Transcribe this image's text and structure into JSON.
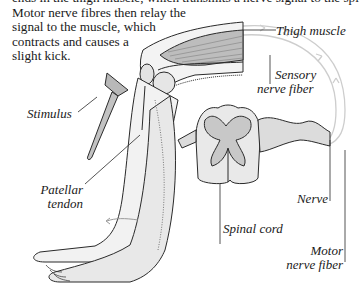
{
  "caption": {
    "lines": [
      "ends in the thigh muscle, which transmits a nerve signal to the spinal cord.",
      "Motor nerve fibres then relay the",
      "signal to the muscle, which",
      "contracts and causes a",
      "slight kick."
    ]
  },
  "labels": {
    "thigh_muscle": "Thigh muscle",
    "sensory_nerve_fiber": [
      "Sensory",
      "nerve fiber"
    ],
    "stimulus": "Stimulus",
    "patellar_tendon": [
      "Patellar",
      "tendon"
    ],
    "spinal_cord": "Spinal cord",
    "nerve": "Nerve",
    "motor_nerve_fiber": [
      "Motor",
      "nerve fiber"
    ]
  },
  "colors": {
    "line": "#2a2a2a",
    "skin_fill": "#efefef",
    "shade": "#cfcfcf",
    "pathway": "#c8c8c8"
  }
}
